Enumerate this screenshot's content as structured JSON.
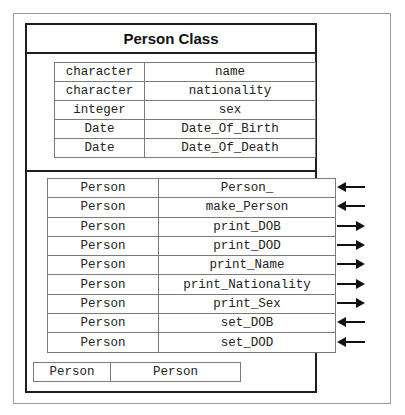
{
  "diagram": {
    "title": "Person Class",
    "attributes": [
      {
        "type": "character",
        "name": "name"
      },
      {
        "type": "character",
        "name": "nationality"
      },
      {
        "type": "integer",
        "name": "sex"
      },
      {
        "type": "Date",
        "name": "Date_Of_Birth"
      },
      {
        "type": "Date",
        "name": "Date_Of_Death"
      }
    ],
    "methods": [
      {
        "type": "Person",
        "name": "Person_",
        "arrow": "in"
      },
      {
        "type": "Person",
        "name": "make_Person",
        "arrow": "in"
      },
      {
        "type": "Person",
        "name": "print_DOB",
        "arrow": "out"
      },
      {
        "type": "Person",
        "name": "print_DOD",
        "arrow": "out"
      },
      {
        "type": "Person",
        "name": "print_Name",
        "arrow": "out"
      },
      {
        "type": "Person",
        "name": "print_Nationality",
        "arrow": "out"
      },
      {
        "type": "Person",
        "name": "print_Sex",
        "arrow": "out"
      },
      {
        "type": "Person",
        "name": "set_DOB",
        "arrow": "in"
      },
      {
        "type": "Person",
        "name": "set_DOD",
        "arrow": "in"
      }
    ],
    "constructor": {
      "type": "Person",
      "name": "Person"
    },
    "colors": {
      "thick_border": "#1e1e1e",
      "cell_border": "#7a7a7a",
      "frame_border": "#9a9a9a"
    }
  }
}
